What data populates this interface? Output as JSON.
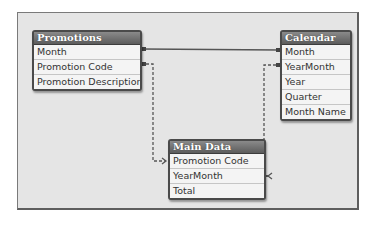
{
  "diagram": {
    "tables": [
      {
        "id": "promotions",
        "title": "Promotions",
        "fields": [
          "Month",
          "Promotion Code",
          "Promotion Description"
        ]
      },
      {
        "id": "calendar",
        "title": "Calendar",
        "fields": [
          "Month",
          "YearMonth",
          "Year",
          "Quarter",
          "Month Name"
        ]
      },
      {
        "id": "main-data",
        "title": "Main Data",
        "fields": [
          "Promotion Code",
          "YearMonth",
          "Total"
        ]
      }
    ],
    "links": [
      {
        "from": "Promotions.Month",
        "to": "Calendar.Month",
        "style": "solid"
      },
      {
        "from": "Promotions.Promotion Code",
        "to": "Main Data.Promotion Code",
        "style": "dashed-arrow"
      },
      {
        "from": "Calendar.YearMonth",
        "to": "Main Data.YearMonth",
        "style": "dashed-arrow"
      }
    ],
    "colors": {
      "canvas": "#e5e5e5",
      "header": "#6e6e6e",
      "line": "#555555"
    }
  }
}
